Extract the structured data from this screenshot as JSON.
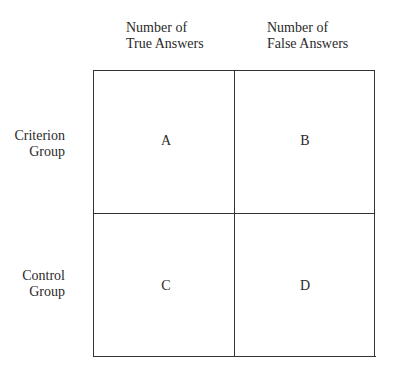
{
  "columns": [
    {
      "line1": "Number of",
      "line2": "True Answers"
    },
    {
      "line1": "Number of",
      "line2": "False Answers"
    }
  ],
  "rows": [
    {
      "line1": "Criterion",
      "line2": "Group"
    },
    {
      "line1": "Control",
      "line2": "Group"
    }
  ],
  "cells": {
    "a": "A",
    "b": "B",
    "c": "C",
    "d": "D"
  }
}
